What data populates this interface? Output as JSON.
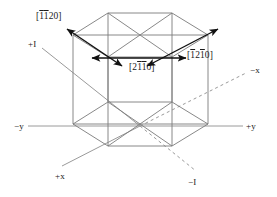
{
  "figure": {
    "name": "hexagonal-crystal-axes-diagram",
    "colors": {
      "prism_line": "#7b7b7b",
      "axis_line": "#9a9a9a",
      "arrow": "#111111",
      "text": "#1a1a1a",
      "background": "#ffffff"
    }
  },
  "axes": [
    {
      "id": "plus-I",
      "label": "+I",
      "x": 28,
      "y": 40
    },
    {
      "id": "minus-x",
      "label": "−x",
      "x": 250,
      "y": 66
    },
    {
      "id": "minus-y",
      "label": "−y",
      "x": 14,
      "y": 122
    },
    {
      "id": "plus-y",
      "label": "+y",
      "x": 246,
      "y": 122
    },
    {
      "id": "plus-x",
      "label": "+x",
      "x": 55,
      "y": 172
    },
    {
      "id": "minus-I",
      "label": "−I",
      "x": 188,
      "y": 178
    }
  ],
  "directions": [
    {
      "id": "dir-1120",
      "label": "[̄1̄1 2 0]",
      "digits": [
        {
          "char": "1",
          "bar": true
        },
        {
          "char": "1",
          "bar": true
        },
        {
          "char": "2",
          "bar": false
        },
        {
          "char": "0",
          "bar": false
        }
      ],
      "x": 36,
      "y": 12
    },
    {
      "id": "dir-2110",
      "label": "[2 ̄1 ̄1 0]",
      "digits": [
        {
          "char": "2",
          "bar": false
        },
        {
          "char": "1",
          "bar": true
        },
        {
          "char": "1",
          "bar": true
        },
        {
          "char": "0",
          "bar": false
        }
      ],
      "x": 129,
      "y": 63
    },
    {
      "id": "dir-1210",
      "label": "[̄1 2 ̄1 0]",
      "digits": [
        {
          "char": "1",
          "bar": true
        },
        {
          "char": "2",
          "bar": false
        },
        {
          "char": "1",
          "bar": true
        },
        {
          "char": "0",
          "bar": false
        }
      ],
      "x": 187,
      "y": 51
    }
  ],
  "brackets": {
    "open": "[",
    "close": "]"
  }
}
